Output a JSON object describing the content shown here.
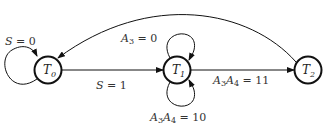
{
  "diagram": {
    "type": "state-transition-diagram",
    "nodes": [
      {
        "id": "T0",
        "label": "T",
        "sub": "0",
        "cx": 48,
        "cy": 70
      },
      {
        "id": "T1",
        "label": "T",
        "sub": "1",
        "cx": 177,
        "cy": 70
      },
      {
        "id": "T2",
        "label": "T",
        "sub": "2",
        "cx": 308,
        "cy": 70
      }
    ],
    "edges": [
      {
        "from": "T0",
        "to": "T0",
        "label": "S = 0"
      },
      {
        "from": "T0",
        "to": "T1",
        "label": "S = 1"
      },
      {
        "from": "T1",
        "to": "T1",
        "label": "A3 = 0",
        "position": "top"
      },
      {
        "from": "T1",
        "to": "T1",
        "label": "A3A4 = 10",
        "position": "bottom"
      },
      {
        "from": "T1",
        "to": "T2",
        "label": "A3A4 = 11"
      },
      {
        "from": "T2",
        "to": "T0",
        "label": ""
      }
    ],
    "labels": {
      "s0_var": "S",
      "s0_rest": " = 0",
      "s1_var": "S",
      "s1_rest": " = 1",
      "a3_var": "A",
      "a3_sub": "3",
      "a3_rest": " = 0",
      "a3a4_10_a": "A",
      "a3a4_10_s1": "3",
      "a3a4_10_b": "A",
      "a3a4_10_s2": "4",
      "a3a4_10_rest": " = 10",
      "a3a4_11_a": "A",
      "a3a4_11_s1": "3",
      "a3a4_11_b": "A",
      "a3a4_11_s2": "4",
      "a3a4_11_rest": " = 11"
    },
    "colors": {
      "stroke": "#111111",
      "text": "#333333"
    }
  }
}
